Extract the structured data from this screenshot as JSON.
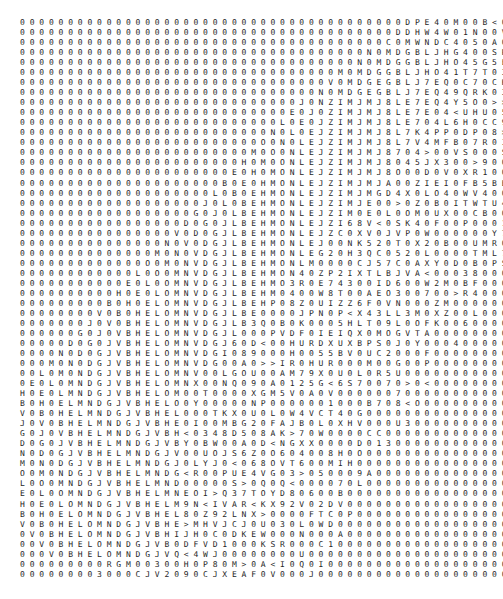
{
  "view": {
    "kind": "character-matrix-dump",
    "background_color": "#ffffff",
    "text_color": "#262626",
    "font_size_px": 8,
    "cell_width_px": 7.17,
    "cell_height_px": 10.04,
    "origin_x_px": 20,
    "origin_y_px": 18,
    "rows": 56,
    "columns": 65,
    "fill_character": "0",
    "separator": " ",
    "description": "Dense monospaced grid of mostly zero values with a diagonal band of varied alphanumeric scores, resembling a dynamic-programming alignment traceback matrix."
  },
  "chart_data": {
    "type": "heatmap",
    "title": "",
    "xlabel": "",
    "ylabel": "",
    "rows": 56,
    "columns": 65,
    "grid": false,
    "legend": false,
    "band": {
      "zero_symbol": "0",
      "symbol_alphabet": "0123456789ABCDEFGHIJKLMNOPQRSTUVWXYZ><",
      "band_start_col_first_row": 40,
      "band_start_col_last_row": 5,
      "band_width_cols": 26,
      "note": "Non-zero characters occupy a descending diagonal band; all cells outside the band are the fill character 0."
    },
    "values": [
      "0000000000000000000000000000000000000000D0E4000000000000000000000",
      "0000000000000000000000000000000000000000DHW4W000000000000000000000",
      "00000000000000000000000000000000000000C0MWNDC40000000000000000000",
      "000000000000000000000000000000000000N0MDGBLJH0400000000000000000",
      "00000000000000000000000000000000000N0MDGGBLJHO4000000000000000000",
      "000000000000000000000000000000000M0MDGGBLJHO4000000000000000000",
      "00000000000000000000000000000000V0MDGEGBLJ7EQ0000000000000000000",
      "0000000000000000000000000000000N0MDGEGBLJ7EQ40000000000000000000",
      "00000000000000000000000000000J0NZIMJMJ8LE7EQ400000000000000000000",
      "0000000000000000000000000000E0J0ZIMJMJ8LE7E04000000000000000000",
      "000000000000000000000000000L0E0JZIMJMJ8LE7040000000000000000000",
      "00000000000000000000000000N0L0EJZIMJMJ8L70400000000000000000000",
      "0000000000000000000000000O0N0LEJZIMJMJ8L704000000000000000000000",
      "000000000000000000000000M0O0NLEJZIMJMJ87040000000000000000000000",
      "00000000000000000000000H0M0ONLEJZIMJMJ8040000000000000000000000",
      "0000000000000000000000E0H0MONLEJZIMJMJ800000000000000000000000",
      "000000000000000000000B0E0HMONLEJZIMJMJ00000000000000000000000",
      "00000000000000000000L0B0EHMONLEJZIMJM000000000000000000000000",
      "0000000000000000000J0L0BEHMONLEJZIMJ0000000000000000000000000",
      "000000000000000000G0J0LBEHMONLEJZIM00000000000000000000000000",
      "00000000000000000D0G0JLBEHMONLEJZI000000000000000000000000000",
      "0000000000000000V0D0GJLBEHMONLEJZ0000000000000000000000000000",
      "000000000000000N0V0DGJLBEHMONLEJ00000000000000000000000000000",
      "00000000000000M0N0VDGJLBEHMONLE000000000000000000000000000000",
      "0000000000000O0M0NVDGJLBEHMONL0000000000000000000000000000000",
      "000000000000L0O0MNVDGJLBEHMON00000000000000000000000000000000",
      "00000000000E0L0OMNVDGJLBEHMO000000000000000000000000000000000",
      "0000000000H0E0LOMNVDGJLBEHM0000000000000000000000000000000000",
      "000000000B0H0ELOMNVDGJLBEH00000000000000000000000000000000000",
      "00000000V0B0HELOMNVDGJLBE000000000000000000000000000000000000",
      "0000000J0V0BHELOMNVDGJLB0000000000000000000000000000000000000",
      "000000G0J0VBHELOMNVDGJL00000000000000000000000000000000000000",
      "00000D0G0JVBHELOMNVDGJ000000000000000000000000000000000000000",
      "0000N0D0GJVBHELOMNVDG0000000000000000000000000000000000000000",
      "000M0N0DGJVBHELOMNVD00000000000000000000000000000000000000000",
      "00L0M0NDGJVBHELOMNV000000000000000000000000000000000000000000",
      "0E0L0MNDGJVBHELOMN0000000000000000000000000000000000000000000",
      "H0E0LMNDGJVBHELOM00000000000000000000000000000000000000000000",
      "B0H0ELMNDGJVBHELO0000000000000000000000000000000000000000000",
      "V0B0HELMNDGJVBHEL000000000000000000000000000000000000000000",
      "J0V0BHELMNDGJVBHE00000000000000000000000000000000000000000",
      "G0J0VBHELMNDGJVBH0000000000000000000000000000000000000000",
      "D0G0JVBHELMNDGJVB000000000000000000000000000000000000000",
      "N0D0GJVBHELMNDGJV00000000000000000000000000000000000000",
      "M0N0DGJVBHELMNDGJ0000000000000000000000000000000000000",
      "O0M0NDGJVBHELMNDG000000000000000000000000000000000000",
      "L0O0MNDGJVBHELMND00000000000000000000000000000000000",
      "E0L0OMNDGJVBHELMN0000000000000000000000000000000000",
      "H0E0LOMNDGJVBHELM000000000000000000000000000000000",
      "B0H0ELOMNDGJVBHEL00000000000000000000000000000000",
      "V0B0HELOMNDGJVBHE0000000000000000000000000000000",
      "0V0BHELOMNDGJVBH000000000000000000000000000000",
      "00V0BHELOMNDGJVB00000000000000000000000000000",
      "000V0BHELOMNDGJV0000000000000000000000000000",
      "0000000000000000000000000000000000000000000000000000000000000000",
      "0000000000000000000000000000000000000000000000000000000000000000"
    ]
  }
}
